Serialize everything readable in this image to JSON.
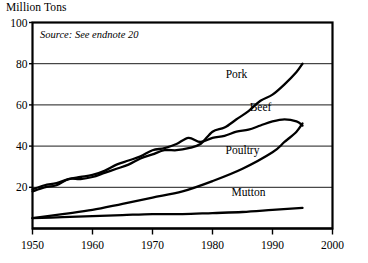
{
  "chart_data": {
    "type": "line",
    "title": "",
    "ylabel": "Million Tons",
    "xlabel": "",
    "source_note": "Source: See endnote 20",
    "xlim": [
      1950,
      2000
    ],
    "ylim": [
      0,
      100
    ],
    "xticks": [
      "1950",
      "1960",
      "1970",
      "1980",
      "1990",
      "2000"
    ],
    "xtick_values": [
      1950,
      1960,
      1970,
      1980,
      1990,
      2000
    ],
    "yticks": [
      "20",
      "40",
      "60",
      "80",
      "100"
    ],
    "ytick_values": [
      20,
      40,
      60,
      80,
      100
    ],
    "grid": true,
    "legend_position": "inline-labels",
    "series": [
      {
        "name": "Pork",
        "label": "Pork",
        "label_x": 1984,
        "label_y": 73,
        "x": [
          1950,
          1952,
          1954,
          1956,
          1958,
          1960,
          1962,
          1964,
          1966,
          1968,
          1970,
          1972,
          1974,
          1976,
          1978,
          1980,
          1982,
          1984,
          1986,
          1988,
          1990,
          1992,
          1994,
          1995
        ],
        "values": [
          18,
          20,
          21,
          24,
          24,
          25,
          27,
          29,
          31,
          34,
          36,
          38,
          38,
          39,
          41,
          47,
          49,
          53,
          57,
          62,
          65,
          70,
          76,
          80
        ]
      },
      {
        "name": "Beef",
        "label": "Beef",
        "label_x": 1988,
        "label_y": 57,
        "x": [
          1950,
          1952,
          1954,
          1956,
          1958,
          1960,
          1962,
          1964,
          1966,
          1968,
          1970,
          1972,
          1974,
          1976,
          1978,
          1980,
          1982,
          1984,
          1986,
          1988,
          1990,
          1992,
          1994,
          1995
        ],
        "values": [
          19,
          21,
          22,
          24,
          25,
          26,
          28,
          31,
          33,
          35,
          38,
          39,
          41,
          44,
          42,
          44,
          45,
          47,
          48,
          50,
          52,
          53,
          52,
          50
        ]
      },
      {
        "name": "Poultry",
        "label": "Poultry",
        "label_x": 1985,
        "label_y": 36,
        "x": [
          1950,
          1955,
          1960,
          1965,
          1970,
          1975,
          1980,
          1985,
          1990,
          1992,
          1994,
          1995
        ],
        "values": [
          5,
          7,
          9,
          12,
          15,
          18,
          23,
          29,
          37,
          42,
          47,
          51
        ]
      },
      {
        "name": "Mutton",
        "label": "Mutton",
        "label_x": 1986,
        "label_y": 16,
        "x": [
          1950,
          1955,
          1960,
          1965,
          1970,
          1975,
          1980,
          1985,
          1990,
          1995
        ],
        "values": [
          5,
          5.5,
          6,
          6.5,
          7,
          7,
          7.5,
          8,
          9,
          10
        ]
      }
    ]
  }
}
